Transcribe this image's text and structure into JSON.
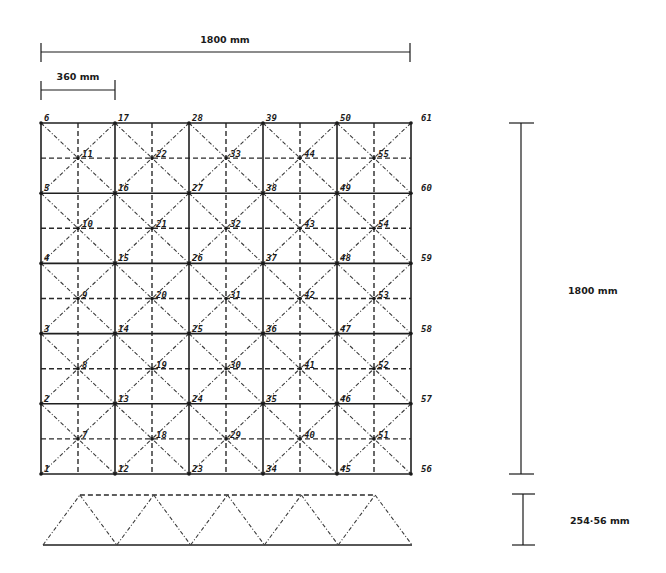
{
  "dimensions": {
    "total_width": "1800 mm",
    "module_width": "360 mm",
    "total_height": "1800 mm",
    "depth": "254·56 mm"
  },
  "grid": {
    "columns": 5,
    "rows": 5,
    "top_node_columns": [
      [
        "1",
        "2",
        "3",
        "4",
        "5",
        "6"
      ],
      [
        "12",
        "13",
        "14",
        "15",
        "16",
        "17"
      ],
      [
        "23",
        "24",
        "25",
        "26",
        "27",
        "28"
      ],
      [
        "34",
        "35",
        "36",
        "37",
        "38",
        "39"
      ],
      [
        "45",
        "46",
        "47",
        "48",
        "49",
        "50"
      ],
      [
        "56",
        "57",
        "58",
        "59",
        "60",
        "61"
      ]
    ],
    "bottom_node_columns": [
      [
        "7",
        "8",
        "9",
        "10",
        "11"
      ],
      [
        "18",
        "19",
        "20",
        "21",
        "22"
      ],
      [
        "29",
        "30",
        "31",
        "32",
        "33"
      ],
      [
        "40",
        "41",
        "42",
        "43",
        "44"
      ],
      [
        "51",
        "52",
        "53",
        "54",
        "55"
      ]
    ]
  },
  "side_view": {
    "label": "space truss elevation"
  }
}
